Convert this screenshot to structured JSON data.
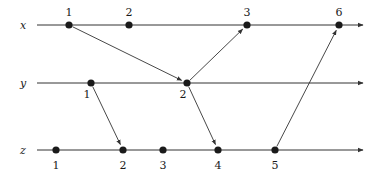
{
  "diagram": {
    "type": "space-time process diagram",
    "colors": {
      "ink": "#1a1a1a",
      "line": "#333333",
      "background": "#ffffff"
    },
    "processes": [
      {
        "name": "x",
        "y": 25,
        "x_start": 37,
        "x_end": 363,
        "events": [
          {
            "label": "1",
            "x": 69
          },
          {
            "label": "2",
            "x": 129
          },
          {
            "label": "3",
            "x": 247
          },
          {
            "label": "6",
            "x": 339
          }
        ]
      },
      {
        "name": "y",
        "y": 83,
        "x_start": 37,
        "x_end": 363,
        "events": [
          {
            "label": "1",
            "x": 91
          },
          {
            "label": "2",
            "x": 187
          }
        ]
      },
      {
        "name": "z",
        "y": 150,
        "x_start": 37,
        "x_end": 363,
        "events": [
          {
            "label": "1",
            "x": 56
          },
          {
            "label": "2",
            "x": 123
          },
          {
            "label": "3",
            "x": 163
          },
          {
            "label": "4",
            "x": 218
          },
          {
            "label": "5",
            "x": 275
          }
        ]
      }
    ],
    "messages": [
      {
        "from": "x.1",
        "to": "y.2"
      },
      {
        "from": "y.1",
        "to": "z.2"
      },
      {
        "from": "y.2",
        "to": "x.3"
      },
      {
        "from": "y.2",
        "to": "z.4"
      },
      {
        "from": "z.5",
        "to": "x.6"
      }
    ]
  }
}
